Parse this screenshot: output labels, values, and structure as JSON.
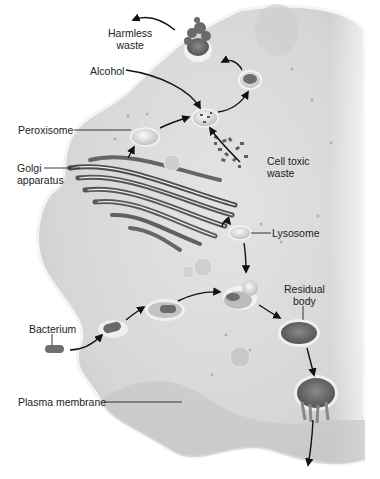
{
  "diagram": {
    "labels": {
      "harmless_waste": [
        "Harmless",
        "waste"
      ],
      "alcohol": "Alcohol",
      "peroxisome": "Peroxisome",
      "golgi": [
        "Golgi",
        "apparatus"
      ],
      "cell_toxic_waste": [
        "Cell toxic",
        "waste"
      ],
      "lysosome": "Lysosome",
      "residual_body": [
        "Residual",
        "body"
      ],
      "bacterium": "Bacterium",
      "plasma_membrane": "Plasma membrane"
    },
    "colors": {
      "cytoplasm": "#d9d9d9",
      "cytoplasm_light": "#e6e6e6",
      "membrane": "#f2f2f2",
      "organelle_dark": "#5a5a5a",
      "vesicle": "#ececec",
      "arrow": "#111111",
      "text": "#222222"
    }
  }
}
